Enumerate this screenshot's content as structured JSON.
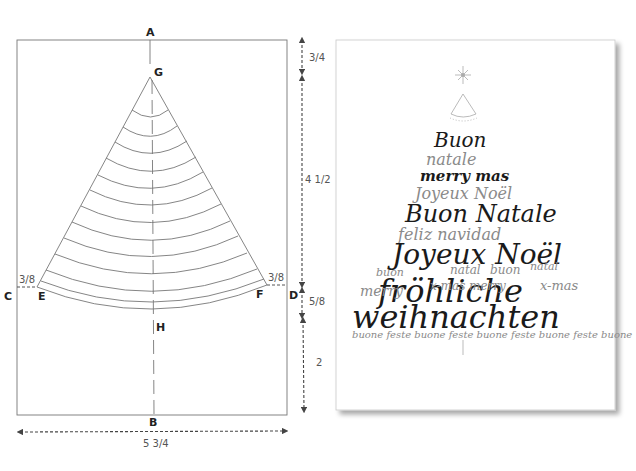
{
  "template_diagram": {
    "points": {
      "A": "A",
      "B": "B",
      "C": "C",
      "D": "D",
      "E": "E",
      "F": "F",
      "G": "G",
      "H": "H"
    },
    "dimensions": {
      "top_gap": "3/4",
      "cone_height": "4 1/2",
      "arc_depth": "5/8",
      "bottom_gap": "2",
      "width": "5 3/4",
      "left_offset": "3/8",
      "right_offset": "3/8"
    },
    "arc_count": 12,
    "colors": {
      "line": "#777777",
      "label": "#222222",
      "dim_arrow": "#444444"
    }
  },
  "card": {
    "words": [
      {
        "text": "Buon",
        "weight": "bold"
      },
      {
        "text": "natale",
        "weight": "light"
      },
      {
        "text": "merry mas",
        "weight": "bold"
      },
      {
        "text": "Joyeux Noël",
        "weight": "light"
      },
      {
        "text": "Buon Natale",
        "weight": "bold"
      },
      {
        "text": "feliz navidad",
        "weight": "light"
      },
      {
        "text": "Joyeux Noël",
        "weight": "bold"
      },
      {
        "text": "buon",
        "weight": "light"
      },
      {
        "text": "natal",
        "weight": "light"
      },
      {
        "text": "buon",
        "weight": "light"
      },
      {
        "text": "natal",
        "weight": "light"
      },
      {
        "text": "fröhliche",
        "weight": "bold"
      },
      {
        "text": "merry",
        "weight": "light"
      },
      {
        "text": "x-mas merry",
        "weight": "light"
      },
      {
        "text": "x-mas",
        "weight": "light"
      },
      {
        "text": "weihnachten",
        "weight": "bold"
      },
      {
        "text": "buone feste buone feste buone feste buone feste buone",
        "weight": "light"
      }
    ],
    "colors": {
      "ink": "#1a1a1a",
      "light_ink": "#8a8a8a",
      "shadow": "#bdbdbd"
    }
  }
}
